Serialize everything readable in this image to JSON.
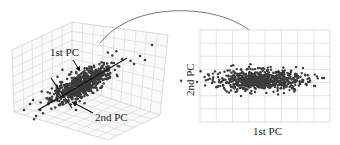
{
  "figure": {
    "left_panel": {
      "type": "3d-scatter",
      "labels": {
        "first_pc": "1st PC",
        "second_pc": "2nd PC"
      },
      "point_count_approx": 700
    },
    "right_panel": {
      "type": "2d-scatter",
      "xlabel": "1st PC",
      "ylabel": "2nd PC",
      "grid_columns": 8,
      "grid_rows": 7,
      "point_count_approx": 700
    },
    "connector": {
      "type": "curved-arrow",
      "from": "left_panel",
      "to": "right_panel"
    },
    "colors": {
      "points": "#3c3c3c",
      "grid": "#d4d4d4",
      "pc_lines": "#111111",
      "text": "#222222"
    }
  }
}
